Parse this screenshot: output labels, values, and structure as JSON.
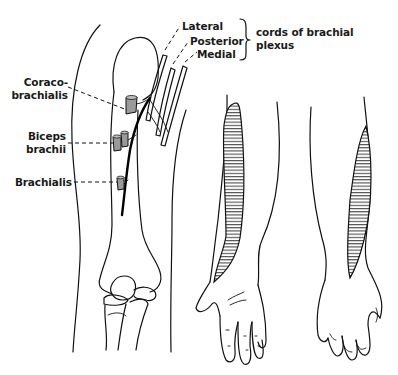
{
  "figure": {
    "labels": {
      "lateral": "Lateral",
      "posterior": "Posterior",
      "medial": "Medial",
      "cords_line1": "cords of brachial",
      "cords_line2": "plexus",
      "coracobrachialis_line1": "Coraco-",
      "coracobrachialis_line2": "brachialis",
      "biceps_line1": "Biceps",
      "biceps_line2": "brachii",
      "brachialis": "Brachialis"
    },
    "panels": [
      {
        "id": "arm-anterior",
        "description": "Upper arm with humerus, muscle branches and brachial plexus cords"
      },
      {
        "id": "forearm-palmar",
        "description": "Forearm and hand, palmar view, lateral sensory area hatched"
      },
      {
        "id": "forearm-dorsal",
        "description": "Forearm and hand, dorsal view, lateral sensory area hatched"
      }
    ],
    "colors": {
      "line": "#111111",
      "background": "#ffffff",
      "muscle_fill": "#9a9a9a"
    }
  }
}
